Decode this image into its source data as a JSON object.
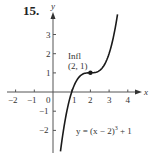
{
  "problem_number": "15.",
  "chart_data": {
    "type": "line",
    "title": "",
    "xlabel": "x",
    "ylabel": "y",
    "xlim": [
      -2.5,
      4.6
    ],
    "ylim": [
      -3.2,
      4.1
    ],
    "grid": false,
    "x_ticks": [
      -2,
      -1,
      0,
      1,
      2,
      3,
      4
    ],
    "x_tick_labels": [
      "−2",
      "−1",
      "0",
      "1",
      "2",
      "3",
      "4"
    ],
    "y_ticks": [
      -2,
      -1,
      1,
      2,
      3
    ],
    "y_tick_labels": [
      "−2",
      "−1",
      "1",
      "2",
      "3"
    ],
    "series": [
      {
        "name": "y = (x − 2)^3 + 1",
        "function": "(x-2)^3+1",
        "x_range": [
          0.4,
          3.45
        ],
        "x": [
          0.4,
          0.6,
          0.8,
          1.0,
          1.2,
          1.4,
          1.6,
          1.8,
          2.0,
          2.2,
          2.4,
          2.6,
          2.8,
          3.0,
          3.2,
          3.45
        ],
        "values": [
          -3.1,
          -1.74,
          -0.73,
          0.0,
          0.49,
          0.78,
          0.94,
          0.99,
          1.0,
          1.01,
          1.06,
          1.22,
          1.51,
          2.0,
          2.73,
          4.05
        ]
      }
    ],
    "points": [
      {
        "x": 2,
        "y": 1,
        "label": "(2, 1)",
        "annotation": "Infl"
      }
    ],
    "annotations": [
      {
        "text": "Infl",
        "x": 2,
        "y": 1
      },
      {
        "text": "(2, 1)",
        "x": 2,
        "y": 1
      },
      {
        "text": "y = (x − 2)³ + 1",
        "position": "lower-right"
      }
    ]
  },
  "labels": {
    "x_axis": "x",
    "y_axis": "y",
    "x_ticks": [
      "−2",
      "−1",
      "0",
      "1",
      "2",
      "3",
      "4"
    ],
    "y_ticks": [
      "3",
      "2",
      "1",
      "−1",
      "−2"
    ],
    "infl": "Infl",
    "point": "(2, 1)",
    "equation_prefix": "y = (x − 2)",
    "equation_exp": "3",
    "equation_suffix": " + 1"
  }
}
